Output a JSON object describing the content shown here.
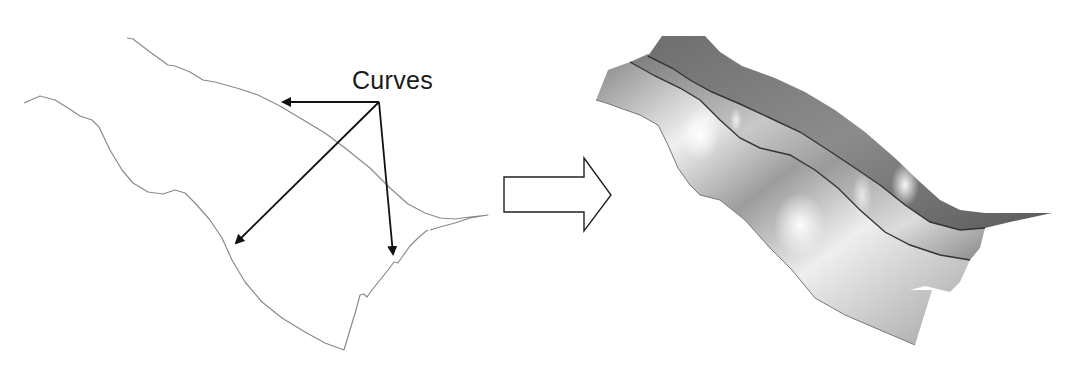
{
  "diagram": {
    "type": "curves-to-surface",
    "left_panel": {
      "label": "Curves",
      "curve_count": 2,
      "arrow_count": 3,
      "curve_color": "#8a8a8a",
      "arrow_color": "#111111"
    },
    "transition_arrow": {
      "style": "hollow-block-arrow",
      "direction": "right",
      "stroke_color": "#222222"
    },
    "right_panel": {
      "object": "lofted-3d-surface",
      "ridge_count": 3,
      "shading_colors": {
        "dark": "#5a5a5a",
        "mid": "#9a9a9a",
        "light": "#e6e6e6",
        "edge": "#3a3a3a"
      }
    }
  }
}
